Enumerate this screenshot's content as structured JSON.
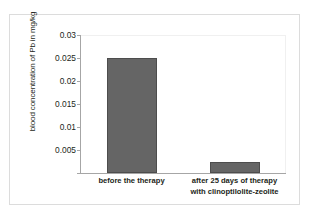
{
  "chart_data": {
    "type": "bar",
    "title": "",
    "xlabel": "",
    "ylabel": "blood concentration of Pb in mg/kg",
    "categories": [
      "before the therapy",
      "after 25 days of therapy with clinoptilolite-zeolite"
    ],
    "category_lines": [
      [
        "before the therapy"
      ],
      [
        "after 25 days of therapy",
        "with clinoptilolite-zeolite"
      ]
    ],
    "values": [
      0.0251,
      0.0024
    ],
    "ylim": [
      0,
      0.03
    ],
    "yticks": [
      0,
      0.005,
      0.01,
      0.015,
      0.02,
      0.025,
      0.03
    ],
    "ytick_labels": [
      "0",
      "0.005",
      "0.01",
      "0.015",
      "0.02",
      "0.025",
      "0.03"
    ],
    "ytick_labels_visible": [
      "0.005",
      "0.01",
      "0.015",
      "0.02",
      "0.025",
      "0.03"
    ],
    "grid": false,
    "legend": false,
    "bar_color": "#656565",
    "bar_edge_color": "#4d4d4d",
    "axis_color": "#a6a6a6",
    "frame_color": "#dcdcdc",
    "text_color": "#231f20"
  }
}
